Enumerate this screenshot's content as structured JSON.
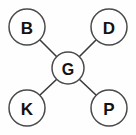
{
  "diagram": {
    "type": "node-link-diagram",
    "background_color": "#fefefe",
    "node_fill_color": "#ffffff",
    "node_stroke_color": "#4a4a4a",
    "edge_color": "#3a3a3a",
    "label_color": "#121212",
    "center_node": {
      "label": "G",
      "cx": 68,
      "cy": 68,
      "r": 16
    },
    "outer_nodes": [
      {
        "label": "B",
        "cx": 27,
        "cy": 27,
        "r": 18,
        "position": "top-left"
      },
      {
        "label": "D",
        "cx": 109,
        "cy": 27,
        "r": 18,
        "position": "top-right"
      },
      {
        "label": "K",
        "cx": 27,
        "cy": 108,
        "r": 18,
        "position": "bottom-left"
      },
      {
        "label": "P",
        "cx": 109,
        "cy": 108,
        "r": 18,
        "position": "bottom-right"
      }
    ],
    "edges": [
      {
        "from": "B",
        "to": "G",
        "x1": 40,
        "y1": 40,
        "x2": 57,
        "y2": 57
      },
      {
        "from": "D",
        "to": "G",
        "x1": 96,
        "y1": 40,
        "x2": 79,
        "y2": 57
      },
      {
        "from": "K",
        "to": "G",
        "x1": 40,
        "y1": 95,
        "x2": 57,
        "y2": 79
      },
      {
        "from": "P",
        "to": "G",
        "x1": 96,
        "y1": 95,
        "x2": 79,
        "y2": 79
      }
    ]
  }
}
